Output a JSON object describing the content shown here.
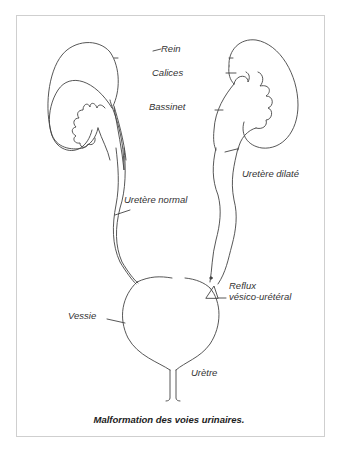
{
  "figure": {
    "caption": "Malformation des voies urinaires.",
    "labels": {
      "rein": "Rein",
      "calices": "Calices",
      "bassinet": "Bassinet",
      "uretere_dilate": "Uretère dilaté",
      "uretere_normal": "Uretère normal",
      "reflux_line1": "Reflux",
      "reflux_line2": "vésico-urétéral",
      "vessie": "Vessie",
      "uretre": "Urètre"
    },
    "colors": {
      "line": "#444444",
      "frame": "#cfcfcf",
      "text": "#333333"
    }
  }
}
